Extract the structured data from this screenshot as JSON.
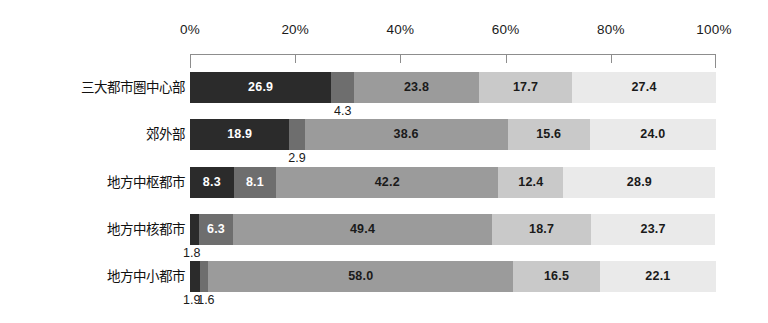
{
  "chart_data": {
    "type": "bar",
    "orientation": "horizontal",
    "stacked": true,
    "stack_mode": "percent",
    "title": "",
    "subtitle": "",
    "xlabel": "",
    "ylabel": "",
    "xlim": [
      0,
      100
    ],
    "grid": false,
    "legend": "none",
    "axis_tick_labels": [
      "0%",
      "20%",
      "40%",
      "60%",
      "80%",
      "100%"
    ],
    "axis_tick_values": [
      0,
      20,
      40,
      60,
      80,
      100
    ],
    "categories": [
      "三大都市圏中心部",
      "郊外部",
      "地方中枢都市",
      "地方中核都市",
      "地方中小都市"
    ],
    "series": [
      {
        "name": "series-1",
        "color": "#2b2b2b",
        "values": [
          26.9,
          18.9,
          8.3,
          1.8,
          1.9
        ]
      },
      {
        "name": "series-2",
        "color": "#6e6e6e",
        "values": [
          4.3,
          2.9,
          8.1,
          6.3,
          1.6
        ]
      },
      {
        "name": "series-3",
        "color": "#9b9b9b",
        "values": [
          23.8,
          38.6,
          42.2,
          49.4,
          58.0
        ]
      },
      {
        "name": "series-4",
        "color": "#c9c9c9",
        "values": [
          17.7,
          15.6,
          12.4,
          18.7,
          16.5
        ]
      },
      {
        "name": "series-5",
        "color": "#eaeaea",
        "values": [
          27.4,
          24.0,
          28.9,
          23.7,
          22.1
        ]
      }
    ],
    "rows": [
      {
        "category": "三大都市圏中心部",
        "segments": [
          {
            "value": 26.9,
            "label": "26.9",
            "color": "#2b2b2b",
            "label_color": "light",
            "label_placement": "inside"
          },
          {
            "value": 4.3,
            "label": "4.3",
            "color": "#6e6e6e",
            "label_color": "dark",
            "label_placement": "below"
          },
          {
            "value": 23.8,
            "label": "23.8",
            "color": "#9b9b9b",
            "label_color": "dark",
            "label_placement": "inside"
          },
          {
            "value": 17.7,
            "label": "17.7",
            "color": "#c9c9c9",
            "label_color": "dark",
            "label_placement": "inside"
          },
          {
            "value": 27.4,
            "label": "27.4",
            "color": "#eaeaea",
            "label_color": "dark",
            "label_placement": "inside"
          }
        ]
      },
      {
        "category": "郊外部",
        "segments": [
          {
            "value": 18.9,
            "label": "18.9",
            "color": "#2b2b2b",
            "label_color": "light",
            "label_placement": "inside"
          },
          {
            "value": 2.9,
            "label": "2.9",
            "color": "#6e6e6e",
            "label_color": "dark",
            "label_placement": "below"
          },
          {
            "value": 38.6,
            "label": "38.6",
            "color": "#9b9b9b",
            "label_color": "dark",
            "label_placement": "inside"
          },
          {
            "value": 15.6,
            "label": "15.6",
            "color": "#c9c9c9",
            "label_color": "dark",
            "label_placement": "inside"
          },
          {
            "value": 24.0,
            "label": "24.0",
            "color": "#eaeaea",
            "label_color": "dark",
            "label_placement": "inside"
          }
        ]
      },
      {
        "category": "地方中枢都市",
        "segments": [
          {
            "value": 8.3,
            "label": "8.3",
            "color": "#2b2b2b",
            "label_color": "light",
            "label_placement": "inside"
          },
          {
            "value": 8.1,
            "label": "8.1",
            "color": "#6e6e6e",
            "label_color": "light",
            "label_placement": "inside"
          },
          {
            "value": 42.2,
            "label": "42.2",
            "color": "#9b9b9b",
            "label_color": "dark",
            "label_placement": "inside"
          },
          {
            "value": 12.4,
            "label": "12.4",
            "color": "#c9c9c9",
            "label_color": "dark",
            "label_placement": "inside"
          },
          {
            "value": 28.9,
            "label": "28.9",
            "color": "#eaeaea",
            "label_color": "dark",
            "label_placement": "inside"
          }
        ]
      },
      {
        "category": "地方中核都市",
        "segments": [
          {
            "value": 1.8,
            "label": "1.8",
            "color": "#2b2b2b",
            "label_color": "dark",
            "label_placement": "below"
          },
          {
            "value": 6.3,
            "label": "6.3",
            "color": "#6e6e6e",
            "label_color": "light",
            "label_placement": "inside"
          },
          {
            "value": 49.4,
            "label": "49.4",
            "color": "#9b9b9b",
            "label_color": "dark",
            "label_placement": "inside"
          },
          {
            "value": 18.7,
            "label": "18.7",
            "color": "#c9c9c9",
            "label_color": "dark",
            "label_placement": "inside"
          },
          {
            "value": 23.7,
            "label": "23.7",
            "color": "#eaeaea",
            "label_color": "dark",
            "label_placement": "inside"
          }
        ]
      },
      {
        "category": "地方中小都市",
        "segments": [
          {
            "value": 1.9,
            "label": "1.9",
            "color": "#2b2b2b",
            "label_color": "dark",
            "label_placement": "below"
          },
          {
            "value": 1.6,
            "label": "1.6",
            "color": "#6e6e6e",
            "label_color": "dark",
            "label_placement": "below"
          },
          {
            "value": 58.0,
            "label": "58.0",
            "color": "#9b9b9b",
            "label_color": "dark",
            "label_placement": "inside"
          },
          {
            "value": 16.5,
            "label": "16.5",
            "color": "#c9c9c9",
            "label_color": "dark",
            "label_placement": "inside"
          },
          {
            "value": 22.1,
            "label": "22.1",
            "color": "#eaeaea",
            "label_color": "dark",
            "label_placement": "inside"
          }
        ]
      }
    ],
    "callouts": [
      {
        "text": "4.3",
        "row": 0,
        "at_percent": 29.05
      },
      {
        "text": "2.9",
        "row": 1,
        "at_percent": 20.35
      },
      {
        "text": "1.8",
        "row": 3,
        "at_percent": 0.0
      },
      {
        "text": "1.9",
        "row": 4,
        "at_percent": 0.0
      },
      {
        "text": "1.6",
        "row": 4,
        "at_percent": 2.7
      }
    ]
  }
}
